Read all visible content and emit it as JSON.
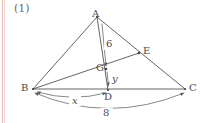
{
  "figure": {
    "question_number": "(1)",
    "background_color": "#ffffff",
    "line_color": "#555555",
    "label_color": "#4a4a4a",
    "margin_rule_color": "#e8b9b4",
    "vertices": [
      {
        "id": "A",
        "label": "A",
        "x": 97,
        "y": 17
      },
      {
        "id": "B",
        "label": "B",
        "x": 33,
        "y": 89
      },
      {
        "id": "C",
        "label": "C",
        "x": 185,
        "y": 89
      },
      {
        "id": "D",
        "label": "D",
        "x": 108,
        "y": 90
      },
      {
        "id": "E",
        "label": "E",
        "x": 139,
        "y": 53
      },
      {
        "id": "G",
        "label": "G",
        "x": 106,
        "y": 69
      }
    ],
    "segments": [
      {
        "from": "A",
        "to": "B"
      },
      {
        "from": "A",
        "to": "C"
      },
      {
        "from": "B",
        "to": "C"
      },
      {
        "from": "A",
        "to": "D"
      },
      {
        "from": "B",
        "to": "E"
      }
    ],
    "measures": [
      {
        "id": "AG",
        "label": "6",
        "from": "A",
        "to": "G",
        "style": "straight-arrow"
      },
      {
        "id": "GD",
        "label": "y",
        "from": "G",
        "to": "D",
        "style": "straight-arrow"
      },
      {
        "id": "BD",
        "label": "x",
        "from": "B",
        "to": "D",
        "style": "curved-double-arrow"
      },
      {
        "id": "BC",
        "label": "8",
        "from": "B",
        "to": "C",
        "style": "curved-double-arrow"
      }
    ]
  }
}
